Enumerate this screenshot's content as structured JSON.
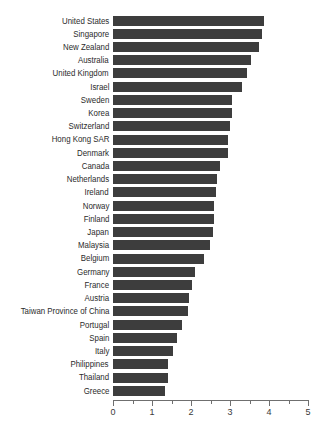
{
  "chart_data": {
    "type": "bar",
    "orientation": "horizontal",
    "title": "",
    "subtitle": "",
    "xlabel": "",
    "ylabel": "",
    "xlim": [
      0,
      5
    ],
    "grid": false,
    "legend": null,
    "bar_color": "#3d3d3d",
    "axis_color": "#6f6f6f",
    "xticks": [
      0,
      1,
      2,
      3,
      4,
      5
    ],
    "xtick_labels": [
      "0",
      "1",
      "2",
      "3",
      "4",
      "5"
    ],
    "xminor_ticks": [
      0.5,
      1.5,
      2.5,
      3.5,
      4.5
    ],
    "categories": [
      "United States",
      "Singapore",
      "New Zealand",
      "Australia",
      "United Kingdom",
      "Israel",
      "Sweden",
      "Korea",
      "Switzerland",
      "Hong Kong SAR",
      "Denmark",
      "Canada",
      "Netherlands",
      "Ireland",
      "Norway",
      "Finland",
      "Japan",
      "Malaysia",
      "Belgium",
      "Germany",
      "France",
      "Austria",
      "Taiwan Province of China",
      "Portugal",
      "Spain",
      "Italy",
      "Philippines",
      "Thailand",
      "Greece"
    ],
    "values": [
      3.87,
      3.82,
      3.74,
      3.55,
      3.44,
      3.31,
      3.05,
      3.05,
      3.0,
      2.95,
      2.95,
      2.74,
      2.67,
      2.64,
      2.59,
      2.59,
      2.56,
      2.49,
      2.33,
      2.1,
      2.03,
      1.95,
      1.92,
      1.77,
      1.64,
      1.54,
      1.41,
      1.41,
      1.33
    ]
  }
}
